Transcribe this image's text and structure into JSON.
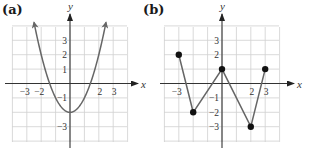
{
  "chart_data": [
    {
      "panel": "(a)",
      "type": "line",
      "function": "y = x^2 - 2",
      "description": "Parabola opening upward with vertex at (0, -2); arrows at both ends",
      "x": [
        -2.5,
        -2,
        -1.5,
        -1,
        -0.5,
        0,
        0.5,
        1,
        1.5,
        2,
        2.5
      ],
      "y": [
        4.25,
        2,
        0.25,
        -1,
        -1.75,
        -2,
        -1.75,
        -1,
        0.25,
        2,
        4.25
      ],
      "xlim": [
        -4,
        4
      ],
      "ylim": [
        -4,
        4
      ],
      "xlabel": "x",
      "ylabel": "y",
      "x_ticks": [
        -3,
        -2,
        2,
        3
      ],
      "y_ticks": [
        3,
        2,
        1,
        -1,
        -3
      ],
      "grid": true,
      "arrows": true
    },
    {
      "panel": "(b)",
      "type": "line",
      "description": "Piecewise linear graph connecting five marked points",
      "points": [
        {
          "x": -3,
          "y": 2
        },
        {
          "x": -2,
          "y": -2
        },
        {
          "x": 0,
          "y": 1
        },
        {
          "x": 2,
          "y": -3
        },
        {
          "x": 3,
          "y": 1
        }
      ],
      "xlim": [
        -4,
        4
      ],
      "ylim": [
        -4,
        4
      ],
      "xlabel": "x",
      "ylabel": "y",
      "x_ticks": [
        -3,
        2,
        3
      ],
      "y_ticks": [
        3,
        2,
        -1,
        -2,
        -3
      ],
      "grid": true,
      "markers": true
    }
  ]
}
